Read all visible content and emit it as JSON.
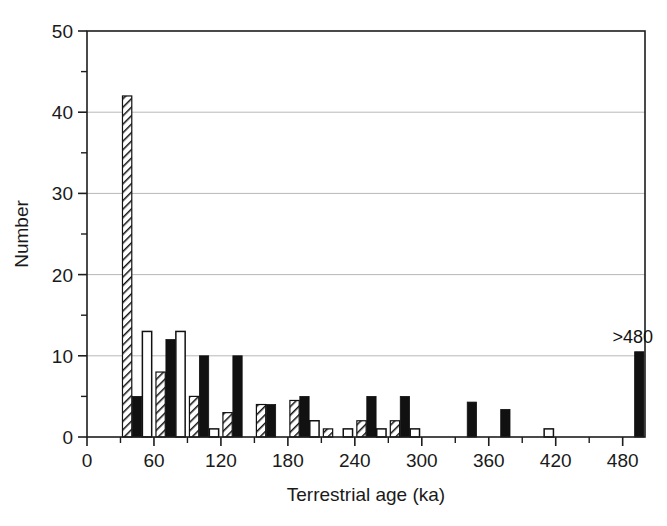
{
  "chart_data": {
    "type": "bar",
    "title": "",
    "xlabel": "Terrestrial age (ka)",
    "ylabel": "Number",
    "xlim": [
      0,
      500
    ],
    "ylim": [
      0,
      50
    ],
    "x_major_ticks": [
      0,
      60,
      120,
      180,
      240,
      300,
      360,
      420,
      480
    ],
    "x_minor_ticks": [
      30,
      90,
      150,
      210,
      270,
      330,
      390,
      450
    ],
    "y_major_ticks": [
      0,
      10,
      20,
      30,
      40,
      50
    ],
    "y_minor_ticks": [
      5,
      15,
      25,
      35,
      45
    ],
    "grid": "horizontal-major",
    "legend": "none",
    "bin_width": 30,
    "bin_starts": [
      0,
      30,
      60,
      90,
      120,
      150,
      180,
      210,
      240,
      270,
      300,
      330,
      360,
      390,
      420,
      450,
      480
    ],
    "series": [
      {
        "name": "hatched",
        "style": "diagonal-hatch",
        "values": [
          0,
          42,
          8,
          5,
          3,
          4,
          4.5,
          1,
          2,
          2,
          0,
          0,
          0,
          0,
          0,
          0,
          0
        ]
      },
      {
        "name": "solid-black",
        "style": "filled-black",
        "values": [
          0,
          5,
          12,
          10,
          10,
          4,
          5,
          0,
          5,
          5,
          0,
          4.3,
          3.4,
          0,
          0,
          0,
          10.5
        ]
      },
      {
        "name": "open-white",
        "style": "open-white",
        "values": [
          0,
          13,
          13,
          1,
          0,
          0,
          2,
          1,
          1,
          1,
          0,
          0,
          0,
          1,
          0,
          0,
          0
        ]
      }
    ],
    "annotations": [
      {
        "text": ">480",
        "x": 480,
        "y": 10.5
      }
    ],
    "x_tick_labels": [
      "0",
      "60",
      "120",
      "180",
      "240",
      "300",
      "360",
      "420",
      "480"
    ],
    "y_tick_labels": [
      "0",
      "10",
      "20",
      "30",
      "40",
      "50"
    ]
  }
}
